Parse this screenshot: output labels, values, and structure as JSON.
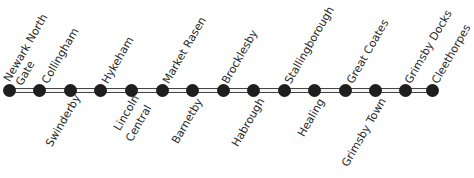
{
  "colors": {
    "dot": "#1e1e1e",
    "rail": "#444444",
    "text": "#2a2a2a"
  },
  "stations": [
    {
      "name": "Newark North Gate",
      "line1": "Newark North",
      "line2": "Gate",
      "side": "above"
    },
    {
      "name": "Collingham",
      "line1": "Collingham",
      "side": "above"
    },
    {
      "name": "Swinderby",
      "line1": "Swinderby",
      "side": "below"
    },
    {
      "name": "Hykeham",
      "line1": "Hykeham",
      "side": "above"
    },
    {
      "name": "Lincoln Central",
      "line1": "Lincoln",
      "line2": "Central",
      "side": "below"
    },
    {
      "name": "Market Rasen",
      "line1": "Market Rasen",
      "side": "above"
    },
    {
      "name": "Barnetby",
      "line1": "Barnetby",
      "side": "below"
    },
    {
      "name": "Brocklesby",
      "line1": "Brocklesby",
      "side": "above"
    },
    {
      "name": "Habrough",
      "line1": "Habrough",
      "side": "below"
    },
    {
      "name": "Stallingborough",
      "line1": "Stallingborough",
      "side": "above"
    },
    {
      "name": "Healing",
      "line1": "Healing",
      "side": "below"
    },
    {
      "name": "Great Coates",
      "line1": "Great Coates",
      "side": "above"
    },
    {
      "name": "Grimsby Town",
      "line1": "Grimsby Town",
      "side": "below"
    },
    {
      "name": "Grimsby Docks",
      "line1": "Grimsby Docks",
      "side": "above"
    },
    {
      "name": "Cleethorpes",
      "line1": "Cleethorpes",
      "side": "above"
    }
  ]
}
